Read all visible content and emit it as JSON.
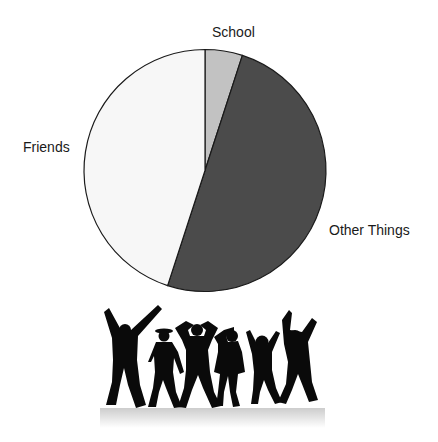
{
  "chart_data": {
    "type": "pie",
    "title": "",
    "start_angle_deg": 0,
    "direction": "clockwise",
    "categories": [
      "School",
      "Other Things",
      "Friends"
    ],
    "values": [
      5,
      50,
      45
    ],
    "unit": "percent (estimated)",
    "colors": [
      "#c2c2c2",
      "#4b4b4b",
      "#f7f7f7"
    ],
    "outline_color": "#1a1a1a",
    "labels_outside": true,
    "legend": "none"
  },
  "labels": {
    "school": "School",
    "other": "Other Things",
    "friends": "Friends"
  },
  "illustration": {
    "description": "Six dancing silhouettes with reflection",
    "figure_count": 6,
    "fill_color": "#0a0a0a"
  }
}
